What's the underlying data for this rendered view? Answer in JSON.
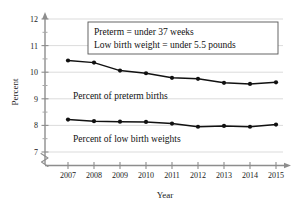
{
  "chart_data": {
    "type": "line",
    "title": "",
    "xlabel": "Year",
    "ylabel": "Percent",
    "x": [
      2007,
      2008,
      2009,
      2010,
      2011,
      2012,
      2013,
      2014,
      2015
    ],
    "categories": [
      "2007",
      "2008",
      "2009",
      "2010",
      "2011",
      "2012",
      "2013",
      "2014",
      "2015"
    ],
    "series": [
      {
        "name": "Percent of preterm births",
        "values": [
          10.44,
          10.36,
          10.06,
          9.96,
          9.79,
          9.75,
          9.6,
          9.56,
          9.62
        ]
      },
      {
        "name": "Percent of low birth weights",
        "values": [
          8.22,
          8.16,
          8.14,
          8.13,
          8.07,
          7.95,
          7.98,
          7.95,
          8.03
        ]
      }
    ],
    "ylim": [
      7,
      12
    ],
    "yticks": [
      7,
      8,
      9,
      10,
      11,
      12
    ],
    "ytick_labels": [
      "7",
      "8",
      "9",
      "10",
      "11",
      "12"
    ],
    "y_minor_ticks": [
      7.5,
      8.5,
      9.5,
      10.5,
      11.5
    ],
    "grid": true,
    "axis_break": true,
    "legend_position": "inline-labels",
    "annotations": [
      {
        "name": "definition-note",
        "lines": [
          "Preterm = under 37 weeks",
          "Low birth weight = under 5.5 pounds"
        ]
      }
    ],
    "series_inline_labels": [
      "Percent of preterm births",
      "Percent of low birth weights"
    ],
    "colors": {
      "line": "#111111",
      "grid": "#d2d2d2",
      "axis": "#8d8d8d",
      "text": "#111111",
      "background": "#ffffff"
    }
  },
  "axis": {
    "y_title": "Percent",
    "x_title": "Year"
  },
  "note": {
    "line1": "Preterm = under 37 weeks",
    "line2": "Low birth weight = under 5.5 pounds"
  },
  "labels": {
    "preterm": "Percent of preterm births",
    "low_birth_weight": "Percent of low birth weights"
  },
  "yticks": {
    "t7": "7",
    "t8": "8",
    "t9": "9",
    "t10": "10",
    "t11": "11",
    "t12": "12"
  },
  "xticks": {
    "x2007": "2007",
    "x2008": "2008",
    "x2009": "2009",
    "x2010": "2010",
    "x2011": "2011",
    "x2012": "2012",
    "x2013": "2013",
    "x2014": "2014",
    "x2015": "2015"
  }
}
